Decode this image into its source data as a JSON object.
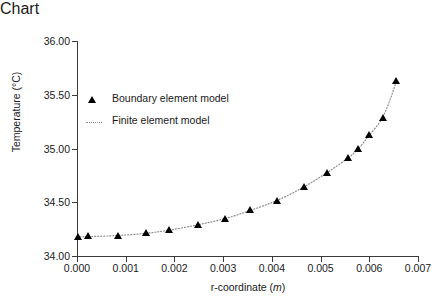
{
  "chart_data": {
    "type": "scatter",
    "title": "",
    "xlabel": "r-coordinate (m)",
    "xlabel_plain": "r-coordinate",
    "xlabel_unit": "m",
    "ylabel": "Temperature (°C)",
    "xlim": [
      0.0,
      0.007
    ],
    "ylim": [
      34.0,
      36.0
    ],
    "xticks": [
      0.0,
      0.001,
      0.002,
      0.003,
      0.004,
      0.005,
      0.006,
      0.007
    ],
    "xtick_labels": [
      "0.000",
      "0.001",
      "0.002",
      "0.003",
      "0.004",
      "0.005",
      "0.006",
      "0.007"
    ],
    "yticks": [
      34.0,
      34.5,
      35.0,
      35.5,
      36.0
    ],
    "ytick_labels": [
      "34.00",
      "34.50",
      "35.00",
      "35.50",
      "36.00"
    ],
    "grid": false,
    "legend_position": "upper left",
    "series": [
      {
        "name": "Boundary element model",
        "marker": "triangle-up",
        "color": "#000000",
        "style": "markers",
        "x": [
          4e-05,
          0.00024,
          0.00085,
          0.00143,
          0.0019,
          0.00249,
          0.00304,
          0.00357,
          0.00412,
          0.00466,
          0.00514,
          0.00558,
          0.00578,
          0.006,
          0.00629,
          0.00656
        ],
        "y": [
          34.18,
          34.182,
          34.19,
          34.21,
          34.24,
          34.29,
          34.345,
          34.425,
          34.515,
          34.64,
          34.775,
          34.915,
          34.995,
          35.125,
          35.28,
          35.625
        ]
      },
      {
        "name": "Finite element model",
        "marker": "none",
        "color": "#8a8a8a",
        "style": "dotted-line",
        "x": [
          0.0,
          0.0004,
          0.00085,
          0.00143,
          0.0019,
          0.00249,
          0.00304,
          0.00357,
          0.00412,
          0.00466,
          0.00514,
          0.00558,
          0.00578,
          0.006,
          0.00629,
          0.00656
        ],
        "y": [
          34.178,
          34.182,
          34.19,
          34.21,
          34.24,
          34.29,
          34.345,
          34.425,
          34.515,
          34.64,
          34.775,
          34.915,
          34.995,
          35.125,
          35.28,
          35.625
        ]
      }
    ],
    "legend": [
      {
        "label": "Boundary element model",
        "glyph": "triangle-marker"
      },
      {
        "label": "Finite element model",
        "glyph": "dotted-line"
      }
    ]
  }
}
